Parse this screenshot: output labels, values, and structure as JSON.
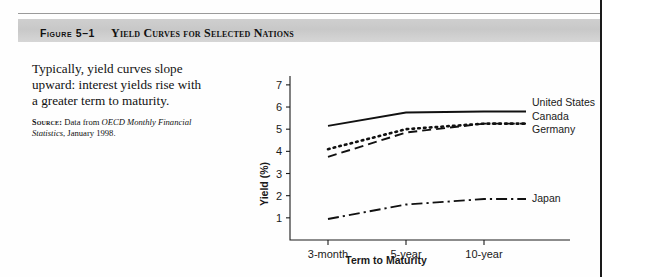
{
  "figure": {
    "number_label": "Figure 5–1",
    "title": "Yield Curves for Selected Nations"
  },
  "caption": {
    "body": "Typically, yield curves slope upward: interest yields rise with a greater term to maturity.",
    "source_label": "Source:",
    "source_text_before": "Data from ",
    "source_italic": "OECD Monthly Financial Statistics",
    "source_text_after": ", January 1998."
  },
  "chart_data": {
    "type": "line",
    "title": "Yield Curves for Selected Nations",
    "xlabel": "Term to Maturity",
    "ylabel": "Yield (%)",
    "categories": [
      "3-month",
      "5-year",
      "10-year"
    ],
    "ylim": [
      0,
      7.4
    ],
    "yticks": [
      1,
      2,
      3,
      4,
      5,
      6,
      7
    ],
    "grid": false,
    "legend_position": "right-inline",
    "series": [
      {
        "name": "United States",
        "values": [
          5.15,
          5.75,
          5.8
        ],
        "style": "solid"
      },
      {
        "name": "Germany",
        "values": [
          4.1,
          5.0,
          5.25
        ],
        "style": "dotted"
      },
      {
        "name": "Canada",
        "values": [
          3.75,
          4.85,
          5.25
        ],
        "style": "dashed"
      },
      {
        "name": "Japan",
        "values": [
          0.95,
          1.6,
          1.85
        ],
        "style": "dash-dot"
      }
    ]
  },
  "axis": {
    "ytick_labels": [
      "1",
      "2",
      "3",
      "4",
      "5",
      "6",
      "7"
    ],
    "xtick_labels": [
      "3-month",
      "5-year",
      "10-year"
    ],
    "y_title": "Yield (%)",
    "x_title": "Term to Maturity"
  },
  "legend": {
    "united_states": "United States",
    "canada": "Canada",
    "germany": "Germany",
    "japan": "Japan"
  }
}
